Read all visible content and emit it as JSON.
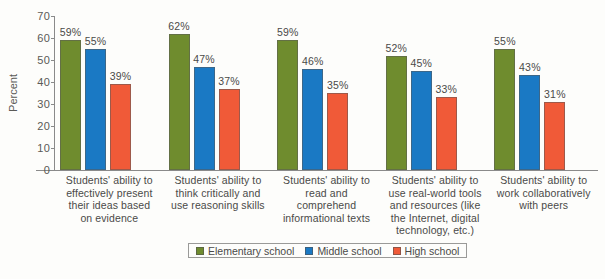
{
  "chart_data": {
    "type": "bar",
    "title": "",
    "xlabel": "",
    "ylabel": "Percent",
    "ylim": [
      0,
      70
    ],
    "yticks": [
      0,
      10,
      20,
      30,
      40,
      50,
      60,
      70
    ],
    "ytick_labels": [
      "0",
      "10",
      "20",
      "30",
      "40",
      "50",
      "60",
      "70"
    ],
    "grid": false,
    "legend_position": "bottom-center",
    "value_suffix": "%",
    "categories": [
      "Students' ability to effectively present their ideas based on evidence",
      "Students' ability to think critically and use reasoning skills",
      "Students' ability to read and comprehend informational texts",
      "Students' ability to use real-world tools and resources (like the Internet, digital technology, etc.)",
      "Students' ability to work collaboratively with peers"
    ],
    "category_lines": [
      [
        "Students' ability to",
        "effectively present",
        "their ideas based",
        "on evidence"
      ],
      [
        "Students' ability to",
        "think critically and",
        "use reasoning skills"
      ],
      [
        "Students' ability to",
        "read and comprehend",
        "informational texts"
      ],
      [
        "Students' ability to",
        "use real-world tools",
        "and resources (like",
        "the Internet, digital",
        "technology, etc.)"
      ],
      [
        "Students' ability to",
        "work collaboratively",
        "with peers"
      ]
    ],
    "series": [
      {
        "name": "Elementary school",
        "color": "#6f8c2e",
        "values": [
          59,
          62,
          59,
          52,
          55
        ],
        "labels": [
          "59%",
          "62%",
          "59%",
          "52%",
          "55%"
        ]
      },
      {
        "name": "Middle school",
        "color": "#1a79c4",
        "values": [
          55,
          47,
          46,
          45,
          43
        ],
        "labels": [
          "55%",
          "47%",
          "46%",
          "45%",
          "43%"
        ]
      },
      {
        "name": "High school",
        "color": "#f05a38",
        "values": [
          39,
          37,
          35,
          33,
          31
        ],
        "labels": [
          "39%",
          "37%",
          "35%",
          "33%",
          "31%"
        ]
      }
    ]
  },
  "caption": {
    "label": "",
    "text": ""
  }
}
